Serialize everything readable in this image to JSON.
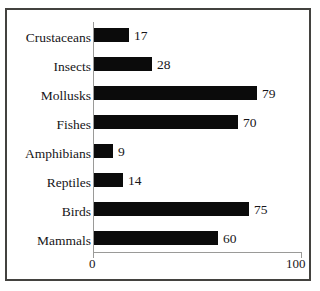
{
  "chart_data": {
    "type": "bar",
    "orientation": "horizontal",
    "title": "",
    "subtitle": "",
    "xlabel": "",
    "ylabel": "",
    "categories": [
      "Crustaceans",
      "Insects",
      "Mollusks",
      "Fishes",
      "Amphibians",
      "Reptiles",
      "Birds",
      "Mammals"
    ],
    "values": [
      17,
      28,
      79,
      70,
      9,
      14,
      75,
      60
    ],
    "xlim": [
      0,
      100
    ],
    "xticks": [
      0,
      100
    ],
    "xtick_labels": [
      "0",
      "100"
    ],
    "grid": false,
    "legend": false,
    "bar_color": "#0b0b0b",
    "axis_color": "#9a9a98",
    "frame_color": "#43423f",
    "background_color": "#ffffff",
    "data_labels_shown": true
  },
  "axis": {
    "tick_0_label": "0",
    "tick_100_label": "100"
  },
  "rows": [
    {
      "label": "Crustaceans",
      "value": 17,
      "value_label": "17"
    },
    {
      "label": "Insects",
      "value": 28,
      "value_label": "28"
    },
    {
      "label": "Mollusks",
      "value": 79,
      "value_label": "79"
    },
    {
      "label": "Fishes",
      "value": 70,
      "value_label": "70"
    },
    {
      "label": "Amphibians",
      "value": 9,
      "value_label": "9"
    },
    {
      "label": "Reptiles",
      "value": 14,
      "value_label": "14"
    },
    {
      "label": "Birds",
      "value": 75,
      "value_label": "75"
    },
    {
      "label": "Mammals",
      "value": 60,
      "value_label": "60"
    }
  ]
}
